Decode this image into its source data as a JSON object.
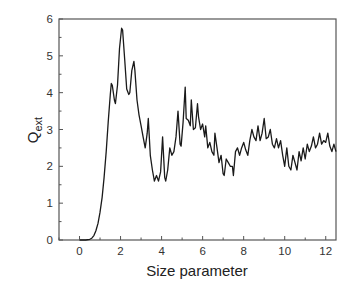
{
  "chart_data": {
    "type": "line",
    "title": "",
    "xlabel": "Size parameter",
    "ylabel": {
      "main": "Q",
      "subscript": "ext"
    },
    "xlim": [
      -1,
      12.5
    ],
    "ylim": [
      0,
      6
    ],
    "x_ticks": [
      0,
      2,
      4,
      6,
      8,
      10,
      12
    ],
    "x_tick_labels": [
      "0",
      "2",
      "4",
      "6",
      "8",
      "10",
      "12"
    ],
    "y_ticks": [
      0,
      1,
      2,
      3,
      4,
      5,
      6
    ],
    "y_tick_labels": [
      "0",
      "1",
      "2",
      "3",
      "4",
      "5",
      "6"
    ],
    "x_minor_step": 1,
    "y_minor_step": 0.5,
    "grid": false,
    "legend": "none",
    "line_color": "#1a1a1a",
    "series": [
      {
        "name": "Qext",
        "x": [
          0,
          0.3,
          0.5,
          0.6,
          0.7,
          0.8,
          0.9,
          1.0,
          1.1,
          1.2,
          1.3,
          1.4,
          1.5,
          1.55,
          1.6,
          1.7,
          1.75,
          1.85,
          1.95,
          2.05,
          2.1,
          2.2,
          2.3,
          2.4,
          2.45,
          2.55,
          2.65,
          2.7,
          2.8,
          2.9,
          3.0,
          3.1,
          3.2,
          3.3,
          3.35,
          3.45,
          3.55,
          3.65,
          3.75,
          3.85,
          3.95,
          4.05,
          4.15,
          4.2,
          4.3,
          4.4,
          4.5,
          4.6,
          4.7,
          4.8,
          4.9,
          4.95,
          5.05,
          5.15,
          5.2,
          5.3,
          5.4,
          5.45,
          5.55,
          5.65,
          5.75,
          5.8,
          5.9,
          6.0,
          6.1,
          6.15,
          6.25,
          6.35,
          6.45,
          6.55,
          6.6,
          6.7,
          6.8,
          6.9,
          7.0,
          7.05,
          7.15,
          7.25,
          7.35,
          7.45,
          7.5,
          7.6,
          7.7,
          7.8,
          7.9,
          8.0,
          8.1,
          8.2,
          8.3,
          8.4,
          8.5,
          8.6,
          8.7,
          8.8,
          8.9,
          9.0,
          9.1,
          9.2,
          9.3,
          9.4,
          9.5,
          9.6,
          9.7,
          9.8,
          9.9,
          10.0,
          10.1,
          10.2,
          10.3,
          10.4,
          10.5,
          10.6,
          10.7,
          10.8,
          10.9,
          11.0,
          11.1,
          11.2,
          11.3,
          11.4,
          11.5,
          11.6,
          11.7,
          11.8,
          11.9,
          12.0,
          12.1,
          12.2,
          12.3,
          12.4,
          12.5
        ],
        "y": [
          0,
          0,
          0.02,
          0.05,
          0.12,
          0.25,
          0.45,
          0.75,
          1.15,
          1.7,
          2.4,
          3.2,
          3.95,
          4.25,
          4.2,
          3.8,
          3.7,
          4.2,
          5.2,
          5.75,
          5.7,
          4.9,
          4.1,
          3.95,
          4.0,
          4.6,
          4.85,
          4.6,
          3.8,
          3.4,
          3.1,
          2.8,
          2.5,
          2.9,
          3.3,
          2.3,
          1.9,
          1.6,
          1.75,
          1.6,
          1.85,
          2.8,
          1.7,
          1.6,
          1.9,
          2.5,
          2.3,
          2.4,
          2.8,
          3.5,
          2.6,
          2.55,
          3.2,
          4.15,
          3.3,
          3.25,
          3.1,
          3.8,
          3.0,
          3.05,
          3.7,
          3.35,
          3.0,
          3.15,
          2.8,
          3.1,
          2.5,
          2.65,
          2.4,
          2.3,
          2.9,
          2.5,
          2.1,
          2.3,
          1.8,
          1.75,
          2.2,
          2.1,
          2.0,
          2.0,
          1.75,
          2.4,
          2.5,
          2.3,
          2.5,
          2.65,
          2.45,
          2.3,
          2.7,
          3.0,
          2.8,
          2.7,
          3.1,
          2.7,
          2.9,
          3.3,
          2.75,
          2.8,
          3.0,
          2.6,
          2.5,
          2.75,
          2.5,
          2.7,
          2.3,
          2.0,
          2.5,
          2.0,
          1.9,
          2.3,
          2.1,
          1.9,
          2.4,
          2.15,
          2.5,
          2.2,
          2.6,
          2.4,
          2.55,
          2.8,
          2.5,
          2.6,
          2.9,
          2.6,
          2.7,
          2.65,
          2.9,
          2.55,
          2.4,
          2.6,
          2.4
        ]
      }
    ]
  }
}
